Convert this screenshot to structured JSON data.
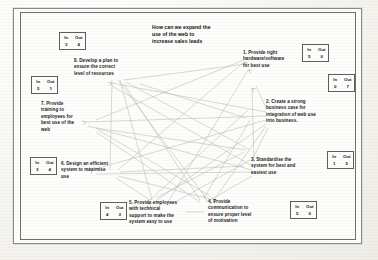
{
  "document": {
    "type": "interrelationship-digraph",
    "title_lines": [
      "How can we expand the",
      "use of the web to",
      "increase sales leads"
    ]
  },
  "nodes": [
    {
      "id": "node-1",
      "number": "1",
      "lines": [
        "1. Provide right",
        "hardware/software",
        "for best use"
      ],
      "in": "5",
      "out": "0"
    },
    {
      "id": "node-2",
      "number": "2",
      "lines": [
        "2. Create a strong",
        "business case for",
        "integration of web use",
        "into business."
      ],
      "in": "0",
      "out": "7"
    },
    {
      "id": "node-3",
      "number": "3",
      "lines": [
        "3. Standardise the",
        "system for best and",
        "easiest use"
      ],
      "in": "1",
      "out": "5"
    },
    {
      "id": "node-4",
      "number": "4",
      "lines": [
        "4. Provide",
        "communication to",
        "ensure proper level",
        "of motivation"
      ],
      "in": "5",
      "out": "0"
    },
    {
      "id": "node-5",
      "number": "5",
      "lines": [
        "5. Provide employees",
        "with technical",
        "support to make the",
        "system easy to use"
      ],
      "in": "4",
      "out": "3"
    },
    {
      "id": "node-6",
      "number": "6",
      "lines": [
        "6. Design an efficient",
        "system to maximise",
        "use"
      ],
      "in": "3",
      "out": "4"
    },
    {
      "id": "node-7",
      "number": "7",
      "lines": [
        "7. Provide",
        "training to",
        "employees for",
        "best use of the",
        "web"
      ],
      "in": "5",
      "out": "1"
    },
    {
      "id": "node-8",
      "number": "8",
      "lines": [
        "8. Develop a plan to",
        "ensure the correct",
        "level of resources"
      ],
      "in": "3",
      "out": "4"
    }
  ],
  "labels": {
    "in": "In",
    "out": "Out"
  },
  "colors": {
    "page": "#fbfaf7",
    "frame": "#6f6f6d",
    "text": "#1b1b1b",
    "edge": "#b9b7b3"
  }
}
